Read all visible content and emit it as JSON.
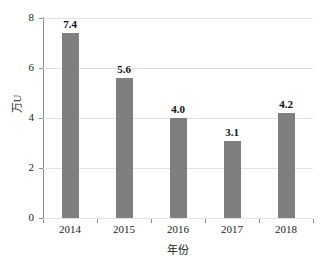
{
  "chart_data": {
    "type": "bar",
    "title": "",
    "subtitle": "",
    "categories": [
      "2014",
      "2015",
      "2016",
      "2017",
      "2018"
    ],
    "values": [
      7.4,
      5.6,
      4.0,
      3.1,
      4.2
    ],
    "data_labels": [
      "7.4",
      "5.6",
      "4.0",
      "3.1",
      "4.2"
    ],
    "xlabel": "年份",
    "ylabel": "万U",
    "ylim": [
      0,
      8
    ],
    "yticks": [
      0,
      2,
      4,
      6,
      8
    ],
    "ytick_labels": [
      "0",
      "2",
      "4",
      "6",
      "8"
    ],
    "grid": true,
    "grid_axis": "y",
    "legend": false,
    "legend_position": "none",
    "bar_color": "#7f7f7f",
    "grid_color": "#e3e3e3",
    "axis_color": "#8c8c8c",
    "text_color": "#1c1c1c"
  }
}
